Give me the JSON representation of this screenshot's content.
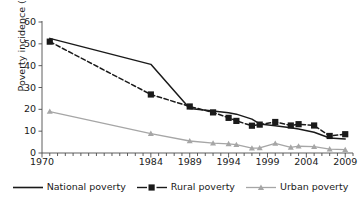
{
  "chart_data": {
    "type": "line",
    "title": "",
    "xlabel": "",
    "ylabel": "Poverty incidence (%)",
    "xlim": [
      1970,
      2010
    ],
    "ylim": [
      0,
      60
    ],
    "ytick_labels": [
      "0",
      "10",
      "20",
      "30",
      "40",
      "50",
      "60"
    ],
    "ytick_values": [
      0,
      10,
      20,
      30,
      40,
      50,
      60
    ],
    "xtick_labels": [
      "1970",
      "1984",
      "1989",
      "1994",
      "1999",
      "2004",
      "2009"
    ],
    "xtick_values": [
      1970,
      1984,
      1989,
      1994,
      1999,
      2004,
      2009
    ],
    "minor_xticks": "annual",
    "grid": false,
    "legend_position": "bottom",
    "series": [
      {
        "name": "National poverty",
        "style": "solid",
        "color": "#1a1a1a",
        "marker": "none",
        "x": [
          1971,
          1984,
          1989,
          1992,
          1994,
          1995,
          1997,
          1998,
          2000,
          2002,
          2003,
          2005,
          2007,
          2009
        ],
        "values": [
          52.5,
          40.6,
          20.4,
          19.2,
          18.4,
          17.8,
          15.5,
          13.3,
          12.5,
          11.6,
          11.0,
          9.5,
          6.9,
          6.4
        ]
      },
      {
        "name": "Rural poverty",
        "style": "dashed",
        "color": "#1a1a1a",
        "marker": "square",
        "x": [
          1971,
          1984,
          1989,
          1992,
          1994,
          1995,
          1997,
          1998,
          2000,
          2002,
          2003,
          2005,
          2007,
          2009
        ],
        "values": [
          51.0,
          26.8,
          21.3,
          18.6,
          16.1,
          14.7,
          12.5,
          13.0,
          14.2,
          12.6,
          13.2,
          12.6,
          7.8,
          8.6
        ]
      },
      {
        "name": "Urban poverty",
        "style": "solid",
        "color": "#a6a6a6",
        "marker": "triangle",
        "x": [
          1971,
          1984,
          1989,
          1992,
          1994,
          1995,
          1997,
          1998,
          2000,
          2002,
          2003,
          2005,
          2007,
          2009
        ],
        "values": [
          19.0,
          8.9,
          5.5,
          4.5,
          4.2,
          3.8,
          2.2,
          2.3,
          4.4,
          2.6,
          3.1,
          2.9,
          1.8,
          1.5
        ]
      }
    ]
  },
  "legend": {
    "items": [
      {
        "label": "National poverty",
        "swatch": "solid-line"
      },
      {
        "label": "Rural poverty",
        "swatch": "dashed-square"
      },
      {
        "label": "Urban poverty",
        "swatch": "line-triangle"
      }
    ]
  }
}
